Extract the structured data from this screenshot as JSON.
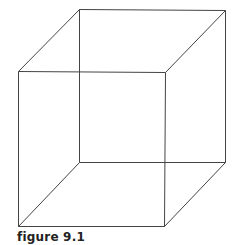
{
  "figure": {
    "caption": "figure 9.1",
    "stroke_color": "#444444",
    "vertices": {
      "back_top_left": [
        79,
        9
      ],
      "back_top_right": [
        225,
        10
      ],
      "back_bottom_left": [
        79,
        162
      ],
      "back_bottom_right": [
        225,
        162
      ],
      "front_top_left": [
        18,
        71
      ],
      "front_top_right": [
        165,
        72
      ],
      "front_bottom_left": [
        18,
        226
      ],
      "front_bottom_right": [
        164,
        226
      ]
    },
    "edges": [
      [
        "back_top_left",
        "back_top_right"
      ],
      [
        "back_top_right",
        "back_bottom_right"
      ],
      [
        "back_bottom_right",
        "back_bottom_left"
      ],
      [
        "back_bottom_left",
        "back_top_left"
      ],
      [
        "front_top_left",
        "front_top_right"
      ],
      [
        "front_top_right",
        "front_bottom_right"
      ],
      [
        "front_bottom_right",
        "front_bottom_left"
      ],
      [
        "front_bottom_left",
        "front_top_left"
      ],
      [
        "front_top_left",
        "back_top_left"
      ],
      [
        "front_top_right",
        "back_top_right"
      ],
      [
        "front_bottom_left",
        "back_bottom_left"
      ],
      [
        "front_bottom_right",
        "back_bottom_right"
      ]
    ]
  }
}
